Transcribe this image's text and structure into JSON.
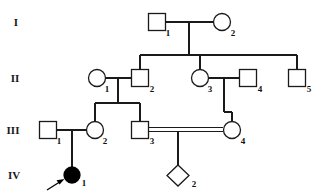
{
  "diagram": {
    "kind": "pedigree-chart",
    "generations": [
      {
        "label": "I",
        "y": 22,
        "label_x": 16
      },
      {
        "label": "II",
        "y": 78,
        "label_x": 15
      },
      {
        "label": "III",
        "y": 130,
        "label_x": 13
      },
      {
        "label": "IV",
        "y": 175,
        "label_x": 14
      }
    ],
    "individuals": [
      {
        "id": "I-1",
        "number": "1",
        "sex": "male",
        "shape": "square",
        "affected": false,
        "x": 157,
        "y": 22,
        "size": 17
      },
      {
        "id": "I-2",
        "number": "2",
        "sex": "female",
        "shape": "circle",
        "affected": false,
        "x": 222,
        "y": 22,
        "size": 17
      },
      {
        "id": "II-1",
        "number": "1",
        "sex": "female",
        "shape": "circle",
        "affected": false,
        "x": 97,
        "y": 78,
        "size": 17
      },
      {
        "id": "II-2",
        "number": "2",
        "sex": "male",
        "shape": "square",
        "affected": false,
        "x": 140,
        "y": 78,
        "size": 17
      },
      {
        "id": "II-3",
        "number": "3",
        "sex": "female",
        "shape": "circle",
        "affected": false,
        "x": 200,
        "y": 78,
        "size": 17
      },
      {
        "id": "II-4",
        "number": "4",
        "sex": "male",
        "shape": "square",
        "affected": false,
        "x": 248,
        "y": 78,
        "size": 17
      },
      {
        "id": "II-5",
        "number": "5",
        "sex": "male",
        "shape": "square",
        "affected": false,
        "x": 297,
        "y": 78,
        "size": 17
      },
      {
        "id": "III-1",
        "number": "1",
        "sex": "male",
        "shape": "square",
        "affected": false,
        "x": 48,
        "y": 130,
        "size": 17
      },
      {
        "id": "III-2",
        "number": "2",
        "sex": "female",
        "shape": "circle",
        "affected": false,
        "x": 95,
        "y": 130,
        "size": 17
      },
      {
        "id": "III-3",
        "number": "3",
        "sex": "male",
        "shape": "square",
        "affected": false,
        "x": 140,
        "y": 130,
        "size": 17
      },
      {
        "id": "III-4",
        "number": "4",
        "sex": "female",
        "shape": "circle",
        "affected": false,
        "x": 232,
        "y": 130,
        "size": 17
      },
      {
        "id": "IV-1",
        "number": "1",
        "sex": "female",
        "shape": "circle",
        "affected": true,
        "x": 72,
        "y": 175,
        "size": 15
      },
      {
        "id": "IV-2",
        "number": "2",
        "sex": "unknown",
        "shape": "diamond",
        "affected": false,
        "x": 178,
        "y": 175,
        "size": 17
      }
    ],
    "matings": [
      {
        "id": "m-I",
        "partners": [
          "I-1",
          "I-2"
        ],
        "consanguineous": false,
        "y": 22,
        "x1": 166,
        "x2": 213
      },
      {
        "id": "m-II-12",
        "partners": [
          "II-1",
          "II-2"
        ],
        "consanguineous": false,
        "y": 78,
        "x1": 106,
        "x2": 131
      },
      {
        "id": "m-II-34",
        "partners": [
          "II-3",
          "II-4"
        ],
        "consanguineous": false,
        "y": 78,
        "x1": 209,
        "x2": 239
      },
      {
        "id": "m-III-12",
        "partners": [
          "III-1",
          "III-2"
        ],
        "consanguineous": false,
        "y": 130,
        "x1": 57,
        "x2": 86
      },
      {
        "id": "m-III-34",
        "partners": [
          "III-3",
          "III-4"
        ],
        "consanguineous": true,
        "y": 130,
        "x1": 149,
        "x2": 223
      }
    ],
    "sibships": [
      {
        "id": "s-I",
        "parent_mating": "m-I",
        "drop_x": 189,
        "drop_from": 31,
        "sib_line_y": 55,
        "children": [
          "II-2",
          "II-3",
          "II-5"
        ],
        "child_xs": [
          140,
          200,
          297
        ]
      },
      {
        "id": "s-II-12",
        "parent_mating": "m-II-12",
        "drop_x": 118,
        "drop_from": 78,
        "sib_line_y": 103,
        "children": [
          "III-2",
          "III-3"
        ],
        "child_xs": [
          95,
          140
        ]
      },
      {
        "id": "s-II-34",
        "parent_mating": "m-II-34",
        "drop_x": 224,
        "drop_from": 78,
        "sib_line_y": 130,
        "children": [
          "III-4"
        ],
        "child_xs": [
          232
        ]
      },
      {
        "id": "s-III-12",
        "parent_mating": "m-III-12",
        "drop_x": 72,
        "drop_from": 130,
        "sib_line_y": 175,
        "children": [
          "IV-1"
        ],
        "child_xs": [
          72
        ]
      },
      {
        "id": "s-III-34",
        "parent_mating": "m-III-34",
        "drop_x": 178,
        "drop_from": 132,
        "sib_line_y": 175,
        "children": [
          "IV-2"
        ],
        "child_xs": [
          178
        ]
      }
    ],
    "proband": {
      "id": "IV-1",
      "marker": "arrow",
      "arrow_tail_x": 47,
      "arrow_tail_y": 190,
      "arrow_tip_x": 63,
      "arrow_tip_y": 180
    },
    "legend": {
      "square_meaning": "male",
      "circle_meaning": "female",
      "diamond_meaning": "sex unknown",
      "filled_meaning": "affected",
      "double_line_meaning": "consanguineous mating",
      "arrow_meaning": "proband"
    },
    "colors": {
      "stroke": "#1a1a1a",
      "fill_unaffected": "#ffffff",
      "fill_affected": "#000000",
      "background": "#ffffff",
      "text": "#111111"
    }
  }
}
